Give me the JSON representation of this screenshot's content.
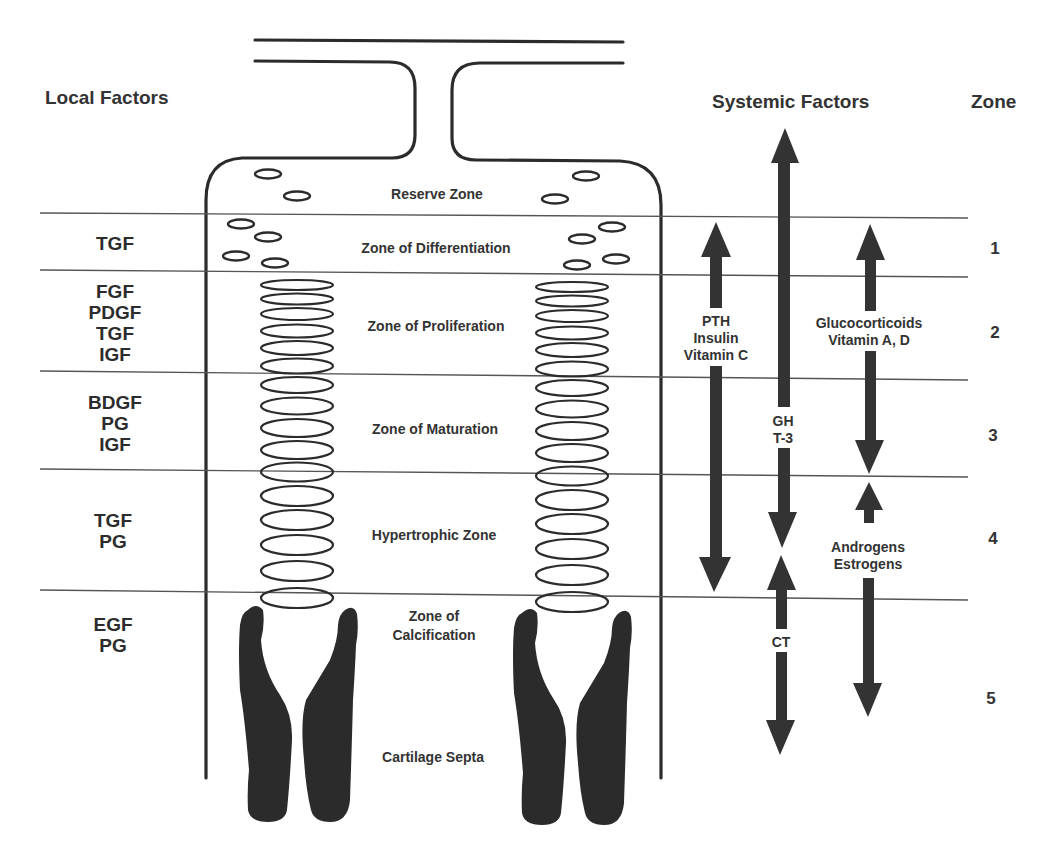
{
  "headers": {
    "local_factors": "Local Factors",
    "systemic_factors": "Systemic Factors",
    "zone": "Zone"
  },
  "zones": [
    {
      "number": "",
      "name": "Reserve Zone",
      "local_factors": []
    },
    {
      "number": "1",
      "name": "Zone of Differentiation",
      "local_factors": [
        "TGF"
      ]
    },
    {
      "number": "2",
      "name": "Zone of Proliferation",
      "local_factors": [
        "FGF",
        "PDGF",
        "TGF",
        "IGF"
      ]
    },
    {
      "number": "3",
      "name": "Zone of Maturation",
      "local_factors": [
        "BDGF",
        "PG",
        "IGF"
      ]
    },
    {
      "number": "4",
      "name": "Hypertrophic Zone",
      "local_factors": [
        "TGF",
        "PG"
      ]
    },
    {
      "number": "5",
      "name_line1": "Zone of",
      "name_line2": "Calcification",
      "local_factors": [
        "EGF",
        "PG"
      ]
    }
  ],
  "bottom_label": "Cartilage Septa",
  "local_text": {
    "z1": "TGF",
    "z2": "FGF\nPDGF\nTGF\nIGF",
    "z3": "BDGF\nPG\nIGF",
    "z4": "TGF\nPG",
    "z5": "EGF\nPG"
  },
  "systemic": {
    "pth_group": {
      "lines": [
        "PTH",
        "Insulin",
        "Vitamin C"
      ],
      "text": "PTH\nInsulin\nVitamin C",
      "zones": "1-4",
      "arrow": "double"
    },
    "gh_group": {
      "lines": [
        "GH",
        "T-3"
      ],
      "text": "GH\nT-3",
      "zones": "reserve-4",
      "arrow": "double"
    },
    "ct_group": {
      "lines": [
        "CT"
      ],
      "text": "CT",
      "zones": "4-5",
      "arrow": "double"
    },
    "gluco_group": {
      "lines": [
        "Glucocorticoids",
        "Vitamin A, D"
      ],
      "text": "Glucocorticoids\nVitamin A, D",
      "zones": "1-3",
      "arrow": "double"
    },
    "andro_group": {
      "lines": [
        "Androgens",
        "Estrogens"
      ],
      "text": "Androgens\nEstrogens",
      "zones": "4-5",
      "arrow": "double"
    }
  },
  "colors": {
    "ink": "#2b2b2b",
    "line": "#555555",
    "background": "#ffffff"
  }
}
